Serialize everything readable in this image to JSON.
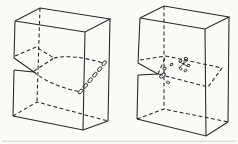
{
  "canvas": {
    "width": 238,
    "height": 144
  },
  "colors": {
    "paper": "#fbfaf7",
    "ink": "#262626",
    "baseline_rule": "#c9c8c0"
  },
  "baseline_rule": {
    "x1": 2,
    "y1": 141.2,
    "x2": 236,
    "y2": 141.2
  },
  "figures": [
    {
      "name": "left-crystal-block",
      "description": "notched block with slipped-region dashed lens and chain of small circles near right face",
      "solid": [
        [
          [
            15,
            21
          ],
          [
            40,
            8
          ],
          [
            110,
            19
          ],
          [
            85,
            32
          ],
          [
            15,
            21
          ]
        ],
        [
          [
            15,
            21
          ],
          [
            14,
            58
          ]
        ],
        [
          [
            14,
            58
          ],
          [
            34,
            72
          ],
          [
            14,
            70
          ]
        ],
        [
          [
            14,
            70
          ],
          [
            13,
            116
          ]
        ],
        [
          [
            13,
            116
          ],
          [
            83,
            130
          ],
          [
            108,
            121
          ]
        ],
        [
          [
            85,
            32
          ],
          [
            83,
            130
          ]
        ],
        [
          [
            110,
            19
          ],
          [
            108,
            121
          ]
        ]
      ],
      "dashed": [
        [
          [
            40,
            8
          ],
          [
            37,
            102
          ]
        ],
        [
          [
            13,
            116
          ],
          [
            37,
            102
          ],
          [
            108,
            121
          ]
        ],
        [
          [
            15,
            56
          ],
          [
            36,
            47
          ],
          [
            54,
            58
          ],
          [
            34,
            71
          ]
        ]
      ],
      "dashed_paths": [
        "M54,58 C66,55.5 82,56.5 103,63",
        "M34,72 C46,82 63,88.5 79,91.5"
      ],
      "ticks": [],
      "ellipses": [
        {
          "cx": 80.5,
          "cy": 91.5,
          "rx": 2.8,
          "ry": 1.6,
          "rot": -50
        },
        {
          "cx": 85.3,
          "cy": 85.9,
          "rx": 2.8,
          "ry": 1.6,
          "rot": -50
        },
        {
          "cx": 90.1,
          "cy": 80.3,
          "rx": 2.8,
          "ry": 1.6,
          "rot": -50
        },
        {
          "cx": 94.9,
          "cy": 74.7,
          "rx": 2.8,
          "ry": 1.6,
          "rot": -50
        },
        {
          "cx": 99.7,
          "cy": 69.1,
          "rx": 2.8,
          "ry": 1.6,
          "rot": -50
        },
        {
          "cx": 104.2,
          "cy": 63.3,
          "rx": 2.8,
          "ry": 1.6,
          "rot": -50
        }
      ]
    },
    {
      "name": "right-crystal-block",
      "description": "notched block with full dashed slip-plane parallelogram and scattered small circles",
      "solid": [
        [
          [
            140,
            18
          ],
          [
            164,
            6
          ],
          [
            229,
            17
          ],
          [
            205,
            29
          ],
          [
            140,
            18
          ]
        ],
        [
          [
            140,
            18
          ],
          [
            138,
            63
          ]
        ],
        [
          [
            138,
            63
          ],
          [
            158,
            74
          ],
          [
            138,
            75
          ]
        ],
        [
          [
            138,
            75
          ],
          [
            137,
            119
          ]
        ],
        [
          [
            137,
            119
          ],
          [
            206,
            136
          ],
          [
            228,
            122
          ]
        ],
        [
          [
            205,
            29
          ],
          [
            206,
            136
          ]
        ],
        [
          [
            229,
            17
          ],
          [
            228,
            122
          ]
        ]
      ],
      "dashed": [
        [
          [
            164,
            6
          ],
          [
            164,
            109
          ]
        ],
        [
          [
            137,
            119
          ],
          [
            164,
            109
          ],
          [
            228,
            122
          ]
        ],
        [
          [
            158,
            74
          ],
          [
            166,
            56
          ],
          [
            222,
            68
          ],
          [
            208,
            87
          ],
          [
            158,
            74
          ]
        ],
        [
          [
            140,
            60
          ],
          [
            166,
            56
          ]
        ]
      ],
      "dashed_paths": [],
      "ticks": [
        [
          183.5,
          64,
          187.5,
          60.5
        ],
        [
          183.5,
          64,
          187.5,
          66.5
        ],
        [
          183.5,
          64,
          180,
          67
        ],
        [
          183.5,
          64,
          179.5,
          62
        ],
        [
          183.5,
          64,
          184.5,
          59.5
        ]
      ],
      "ellipses": [
        {
          "cx": 162.5,
          "cy": 75.5,
          "rx": 3.4,
          "ry": 1.8,
          "rot": -40
        },
        {
          "cx": 164.5,
          "cy": 68.5,
          "rx": 1.7,
          "ry": 1.2,
          "rot": -30
        },
        {
          "cx": 168,
          "cy": 82.5,
          "rx": 1.7,
          "ry": 1.2,
          "rot": 20
        },
        {
          "cx": 171.5,
          "cy": 64.5,
          "rx": 1.4,
          "ry": 1.0,
          "rot": -30
        },
        {
          "cx": 180.5,
          "cy": 61,
          "rx": 1.6,
          "ry": 1.1,
          "rot": -40
        },
        {
          "cx": 186,
          "cy": 58.5,
          "rx": 1.6,
          "ry": 1.1,
          "rot": 30
        },
        {
          "cx": 188.5,
          "cy": 65.5,
          "rx": 1.6,
          "ry": 1.1,
          "rot": -20
        },
        {
          "cx": 180.5,
          "cy": 68.5,
          "rx": 1.6,
          "ry": 1.1,
          "rot": 45
        },
        {
          "cx": 185.5,
          "cy": 70.5,
          "rx": 1.6,
          "ry": 1.1,
          "rot": -45
        }
      ]
    }
  ]
}
